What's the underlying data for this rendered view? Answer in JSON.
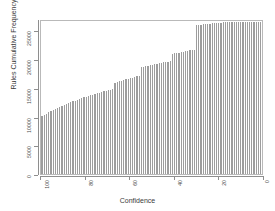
{
  "chart_data": {
    "type": "bar",
    "title": "",
    "subtitle": "",
    "xlabel": "Confidence",
    "ylabel": "Rules Cumulative Frequency",
    "xlim": [
      100,
      0
    ],
    "ylim": [
      0,
      27000
    ],
    "x_axis_reversed": true,
    "grid": false,
    "legend": false,
    "bar_color": "#9d9d9d",
    "background_color": "#ffffff",
    "frame_color": "#b9b9b9",
    "xticks": [
      "100",
      "80",
      "60",
      "40",
      "20",
      "0"
    ],
    "xtick_values": [
      100,
      80,
      60,
      40,
      20,
      0
    ],
    "yticks": [
      "0",
      "5000",
      "10000",
      "15000",
      "20000",
      "25000"
    ],
    "ytick_values": [
      0,
      5000,
      10000,
      15000,
      20000,
      25000
    ],
    "x": [
      100,
      99,
      98,
      97,
      96,
      95,
      94,
      93,
      92,
      91,
      90,
      89,
      88,
      87,
      86,
      85,
      84,
      83,
      82,
      81,
      80,
      79,
      78,
      77,
      76,
      75,
      74,
      73,
      72,
      71,
      70,
      69,
      68,
      67,
      66,
      65,
      64,
      63,
      62,
      61,
      60,
      59,
      58,
      57,
      56,
      55,
      54,
      53,
      52,
      51,
      50,
      49,
      48,
      47,
      46,
      45,
      44,
      43,
      42,
      41,
      40,
      39,
      38,
      37,
      36,
      35,
      34,
      33,
      32,
      31,
      30,
      29,
      28,
      27,
      26,
      25,
      24,
      23,
      22,
      21,
      20,
      19,
      18,
      17,
      16,
      15,
      14,
      13,
      12,
      11,
      10,
      9,
      8,
      7,
      6,
      5,
      4,
      3,
      2,
      1,
      0
    ],
    "values": [
      10050,
      10300,
      10520,
      10740,
      10950,
      11150,
      11340,
      11520,
      11700,
      11870,
      12040,
      12200,
      12360,
      12510,
      12660,
      12800,
      12940,
      13080,
      13210,
      13340,
      13470,
      13590,
      13710,
      13830,
      13950,
      14060,
      14170,
      14280,
      14390,
      14500,
      14600,
      14700,
      14800,
      15900,
      16030,
      16150,
      16270,
      16380,
      16490,
      16600,
      16700,
      16800,
      16900,
      17000,
      17090,
      18600,
      18700,
      18790,
      18880,
      18970,
      19050,
      19130,
      19210,
      19290,
      19360,
      19430,
      19500,
      19570,
      19640,
      20900,
      21000,
      21080,
      21160,
      21240,
      21310,
      21380,
      21450,
      21520,
      21590,
      21660,
      25900,
      25960,
      26020,
      26070,
      26120,
      26170,
      26210,
      26250,
      26290,
      26320,
      26350,
      26380,
      26400,
      26420,
      26440,
      26460,
      26470,
      26480,
      26490,
      26495,
      26500,
      26505,
      26510,
      26515,
      26520,
      26525,
      26528,
      26530,
      26532,
      26534,
      26535
    ],
    "series": [
      {
        "name": "Rules Cumulative Frequency",
        "values": [
          10050,
          10300,
          10520,
          10740,
          10950,
          11150,
          11340,
          11520,
          11700,
          11870,
          12040,
          12200,
          12360,
          12510,
          12660,
          12800,
          12940,
          13080,
          13210,
          13340,
          13470,
          13590,
          13710,
          13830,
          13950,
          14060,
          14170,
          14280,
          14390,
          14500,
          14600,
          14700,
          14800,
          15900,
          16030,
          16150,
          16270,
          16380,
          16490,
          16600,
          16700,
          16800,
          16900,
          17000,
          17090,
          18600,
          18700,
          18790,
          18880,
          18970,
          19050,
          19130,
          19210,
          19290,
          19360,
          19430,
          19500,
          19570,
          19640,
          20900,
          21000,
          21080,
          21160,
          21240,
          21310,
          21380,
          21450,
          21520,
          21590,
          21660,
          25900,
          25960,
          26020,
          26070,
          26120,
          26170,
          26210,
          26250,
          26290,
          26320,
          26350,
          26380,
          26400,
          26420,
          26440,
          26460,
          26470,
          26480,
          26490,
          26495,
          26500,
          26505,
          26510,
          26515,
          26520,
          26525,
          26528,
          26530,
          26532,
          26534,
          26535
        ]
      }
    ]
  }
}
